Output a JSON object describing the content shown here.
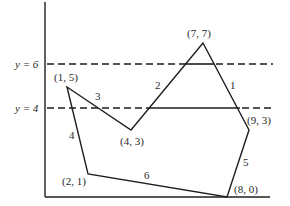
{
  "diagram": {
    "colors": {
      "ink": "#1e1e1e",
      "background": "#ffffff"
    },
    "scanlines": [
      {
        "label": "y = 6",
        "value": 6
      },
      {
        "label": "y = 4",
        "value": 4
      }
    ],
    "vertices": [
      {
        "label": "(7, 7)",
        "x": 7,
        "y": 7
      },
      {
        "label": "(9, 3)",
        "x": 9,
        "y": 3
      },
      {
        "label": "(8, 0)",
        "x": 8,
        "y": 0
      },
      {
        "label": "(2, 1)",
        "x": 2,
        "y": 1
      },
      {
        "label": "(1, 5)",
        "x": 1,
        "y": 5
      },
      {
        "label": "(4, 3)",
        "x": 4,
        "y": 3
      }
    ],
    "edges": [
      {
        "label": "1",
        "from": "(7, 7)",
        "to": "(9, 3)"
      },
      {
        "label": "2",
        "from": "(4, 3)",
        "to": "(7, 7)"
      },
      {
        "label": "3",
        "from": "(1, 5)",
        "to": "(4, 3)"
      },
      {
        "label": "4",
        "from": "(2, 1)",
        "to": "(1, 5)"
      },
      {
        "label": "5",
        "from": "(9, 3)",
        "to": "(8, 0)"
      },
      {
        "label": "6",
        "from": "(8, 0)",
        "to": "(2, 1)"
      }
    ]
  }
}
